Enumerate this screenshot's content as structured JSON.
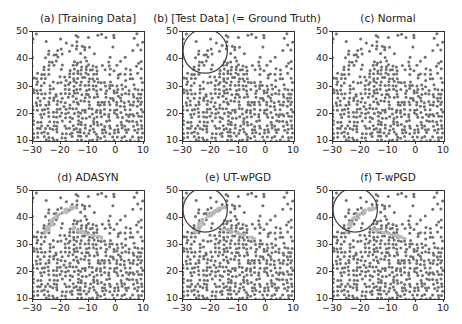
{
  "figure": {
    "layout": "2x3 grid of scatter plots",
    "panels": [
      {
        "id": "a",
        "title": "(a) [Training Data]",
        "circle": false,
        "synthetic": false
      },
      {
        "id": "b",
        "title": "(b) [Test Data] (= Ground Truth)",
        "circle": true,
        "synthetic": false
      },
      {
        "id": "c",
        "title": "(c) Normal",
        "circle": false,
        "synthetic": false
      },
      {
        "id": "d",
        "title": "(d) ADASYN",
        "circle": false,
        "synthetic": true
      },
      {
        "id": "e",
        "title": "(e) UT-wPGD",
        "circle": true,
        "synthetic": true
      },
      {
        "id": "f",
        "title": "(f) T-wPGD",
        "circle": true,
        "synthetic": true
      }
    ],
    "colors": {
      "points": "#6e6e6e",
      "synthetic_points": "#b8b8b8",
      "circle": "#444444",
      "axis": "#333333",
      "background": "#ffffff"
    }
  },
  "chart_data": [
    {
      "type": "scatter",
      "title": "(a) [Training Data]",
      "xlabel": "",
      "ylabel": "",
      "xlim": [
        -30,
        10
      ],
      "ylim": [
        10,
        50
      ],
      "xticks": [
        "-30",
        "-20",
        "-10",
        "0",
        "10"
      ],
      "yticks": [
        "10",
        "20",
        "30",
        "40",
        "50"
      ],
      "grid": false,
      "description": "Dense grey dot field; dense blob centered near (-12,30); arc-shaped streams of dots in upper-left (-28..-18, 38..46); sparse ring-like clusters top-right"
    },
    {
      "type": "scatter",
      "title": "(b) [Test Data] (= Ground Truth)",
      "xlabel": "",
      "ylabel": "",
      "xlim": [
        -30,
        10
      ],
      "ylim": [
        10,
        50
      ],
      "xticks": [
        "-30",
        "-20",
        "-10",
        "0",
        "10"
      ],
      "yticks": [
        "10",
        "20",
        "30",
        "40",
        "50"
      ],
      "grid": false,
      "annotations": [
        {
          "type": "circle",
          "center": [
            -22,
            43
          ],
          "radius": 5.5,
          "note": "highlights upper-left arc region"
        }
      ]
    },
    {
      "type": "scatter",
      "title": "(c) Normal",
      "xlabel": "",
      "ylabel": "",
      "xlim": [
        -30,
        10
      ],
      "ylim": [
        10,
        50
      ],
      "xticks": [
        "-30",
        "-20",
        "-10",
        "0",
        "10"
      ],
      "yticks": [
        "10",
        "20",
        "30",
        "40",
        "50"
      ],
      "grid": false
    },
    {
      "type": "scatter",
      "title": "(d) ADASYN",
      "xlabel": "",
      "ylabel": "",
      "xlim": [
        -30,
        10
      ],
      "ylim": [
        10,
        50
      ],
      "xticks": [
        "-30",
        "-20",
        "-10",
        "0",
        "10"
      ],
      "yticks": [
        "10",
        "20",
        "30",
        "40",
        "50"
      ],
      "grid": false,
      "series": [
        {
          "name": "original",
          "color": "#6e6e6e"
        },
        {
          "name": "synthetic",
          "color": "#b8b8b8"
        }
      ]
    },
    {
      "type": "scatter",
      "title": "(e) UT-wPGD",
      "xlabel": "",
      "ylabel": "",
      "xlim": [
        -30,
        10
      ],
      "ylim": [
        10,
        50
      ],
      "xticks": [
        "-30",
        "-20",
        "-10",
        "0",
        "10"
      ],
      "yticks": [
        "10",
        "20",
        "30",
        "40",
        "50"
      ],
      "grid": false,
      "series": [
        {
          "name": "original",
          "color": "#6e6e6e"
        },
        {
          "name": "synthetic",
          "color": "#b8b8b8"
        }
      ],
      "annotations": [
        {
          "type": "circle",
          "center": [
            -22,
            43
          ],
          "radius": 5.5
        }
      ]
    },
    {
      "type": "scatter",
      "title": "(f) T-wPGD",
      "xlabel": "",
      "ylabel": "",
      "xlim": [
        -30,
        10
      ],
      "ylim": [
        10,
        50
      ],
      "xticks": [
        "-30",
        "-20",
        "-10",
        "0",
        "10"
      ],
      "yticks": [
        "10",
        "20",
        "30",
        "40",
        "50"
      ],
      "grid": false,
      "series": [
        {
          "name": "original",
          "color": "#6e6e6e"
        },
        {
          "name": "synthetic",
          "color": "#b8b8b8"
        }
      ],
      "annotations": [
        {
          "type": "circle",
          "center": [
            -22,
            43
          ],
          "radius": 5.5
        }
      ]
    }
  ]
}
